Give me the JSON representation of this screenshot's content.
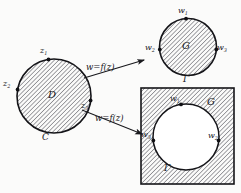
{
  "figure": {
    "colors": {
      "ink": "#16161a",
      "hatch": "#4a4a4a",
      "paper": "#fbfbfa",
      "hole": "#ffffff"
    }
  },
  "ghost_text": {
    "line1": "",
    "line2": "",
    "line3": "",
    "line4": ""
  },
  "source_domain": {
    "region_label": "D",
    "boundary_label": "C",
    "points": [
      {
        "label": "z",
        "sub": "1",
        "position": "top"
      },
      {
        "label": "z",
        "sub": "2",
        "position": "left"
      },
      {
        "label": "z",
        "sub": "3",
        "position": "right"
      }
    ]
  },
  "mappings": [
    {
      "label": "w=f(z)",
      "target": "disk"
    },
    {
      "label": "w=f(z)",
      "target": "exterior"
    }
  ],
  "target_disk": {
    "region_label": "G",
    "boundary_label": "Γ",
    "points": [
      {
        "label": "w",
        "sub": "1",
        "position": "top"
      },
      {
        "label": "w",
        "sub": "2",
        "position": "left"
      },
      {
        "label": "w",
        "sub": "3",
        "position": "right"
      }
    ]
  },
  "target_exterior": {
    "region_label": "G",
    "boundary_label": "Γ",
    "points": [
      {
        "label": "w",
        "sub": "1",
        "position": "top"
      },
      {
        "label": "w",
        "sub": "3",
        "position": "left"
      },
      {
        "label": "w",
        "sub": "2",
        "position": "right"
      }
    ]
  }
}
